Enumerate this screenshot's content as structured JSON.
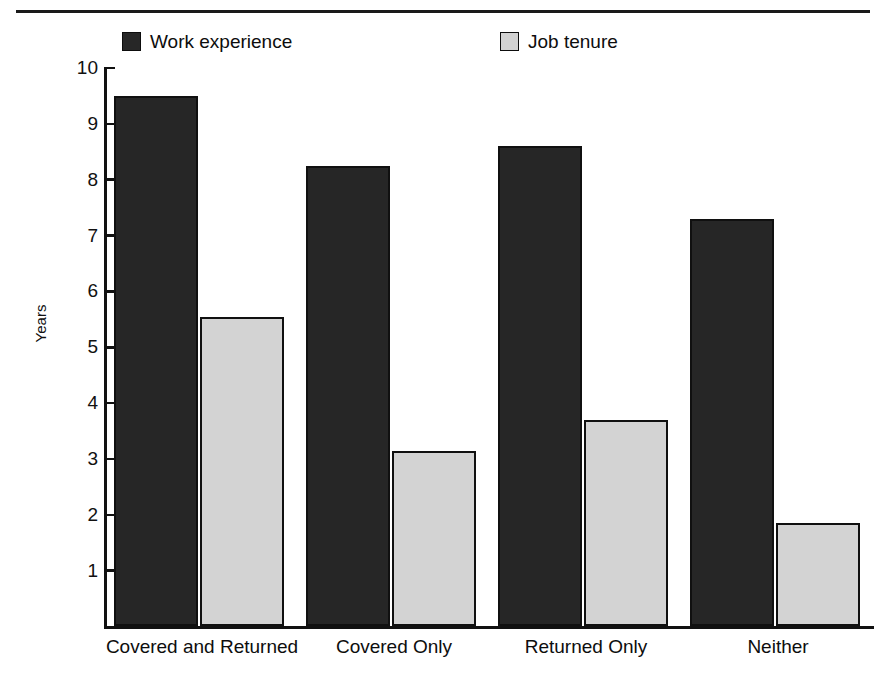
{
  "chart_data": {
    "type": "bar",
    "title": "",
    "xlabel": "",
    "ylabel": "Years",
    "ylim": [
      0,
      10
    ],
    "ytick_labels": [
      "10",
      "9",
      "8",
      "7",
      "6",
      "5",
      "4",
      "3",
      "2",
      "1"
    ],
    "yticks": [
      10,
      9,
      8,
      7,
      6,
      5,
      4,
      3,
      2,
      1
    ],
    "grid": false,
    "legend_position": "top",
    "categories": [
      "Covered and Returned",
      "Covered Only",
      "Returned Only",
      "Neither"
    ],
    "series": [
      {
        "name": "Work experience",
        "color": "#262626",
        "values": [
          9.5,
          8.25,
          8.6,
          7.3
        ]
      },
      {
        "name": "Job tenure",
        "color": "#d3d3d3",
        "values": [
          5.55,
          3.15,
          3.7,
          1.85
        ]
      }
    ]
  },
  "legend": {
    "items": [
      {
        "label": "Work experience",
        "swatch": "dark-square-icon"
      },
      {
        "label": "Job tenure",
        "swatch": "light-square-icon"
      }
    ]
  },
  "axis": {
    "y_title": "Years"
  }
}
